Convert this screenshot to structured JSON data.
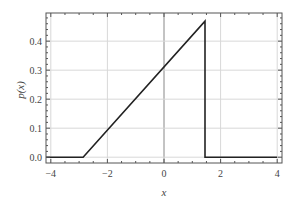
{
  "chart_data": {
    "type": "line",
    "title": "",
    "xlabel": "x",
    "ylabel": "p(x)",
    "xlim": [
      -4.17,
      4.17
    ],
    "ylim": [
      -0.02,
      0.497
    ],
    "grid": true,
    "x_ticks": [
      -4,
      -2,
      0,
      2,
      4
    ],
    "x_tick_labels": [
      "−4",
      "−2",
      "0",
      "2",
      "4"
    ],
    "y_ticks": [
      0.0,
      0.1,
      0.2,
      0.3,
      0.4
    ],
    "y_tick_labels": [
      "0.0",
      "0.1",
      "0.2",
      "0.3",
      "0.4"
    ],
    "series": [
      {
        "name": "p(x)",
        "color": "#222222",
        "x": [
          -4.17,
          -2.86,
          1.45,
          1.45,
          4.0
        ],
        "y": [
          0.0,
          0.0,
          0.469,
          0.0,
          0.0
        ]
      }
    ],
    "legend": null
  },
  "colors": {
    "frame": "#555555",
    "grid": "#d8d8d8",
    "zero_line": "#888888",
    "curve": "#222222"
  }
}
